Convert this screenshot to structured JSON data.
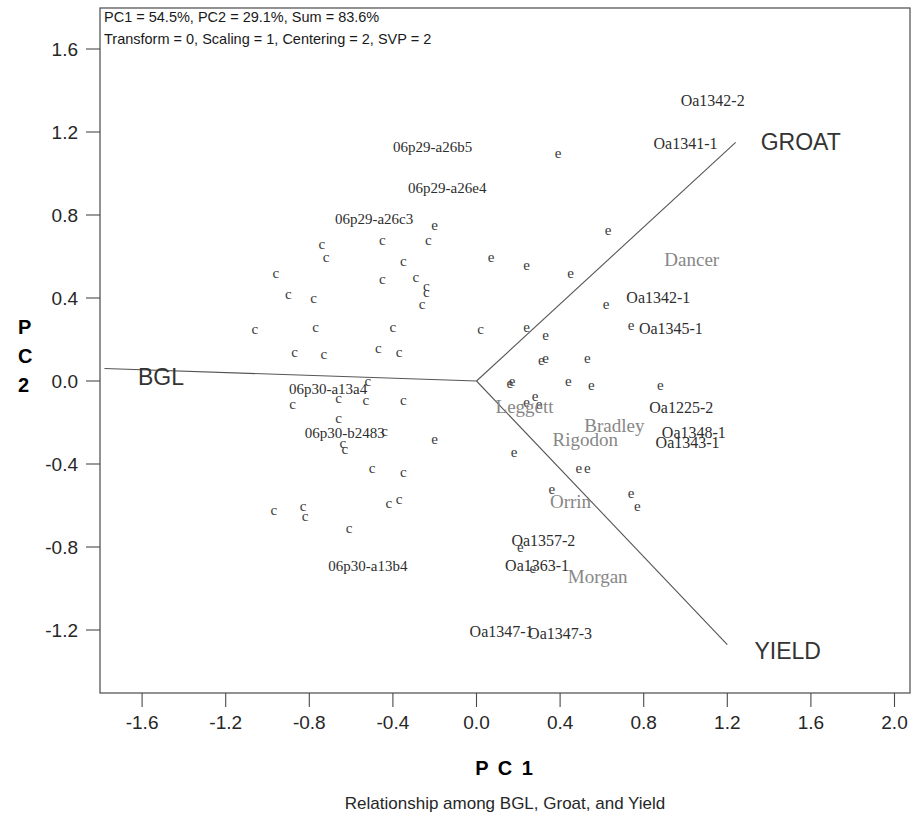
{
  "header": {
    "line1": "PC1 = 54.5%, PC2 = 29.1%, Sum = 83.6%",
    "line2": "Transform = 0, Scaling = 1, Centering = 2, SVP = 2"
  },
  "caption": "Relationship among BGL, Groat, and Yield",
  "axis": {
    "x_title": "P C 1",
    "y_title_chars": [
      "P",
      "C",
      "2"
    ]
  },
  "chart_data": {
    "type": "scatter",
    "title": "Relationship among BGL, Groat, and Yield",
    "subtitle": "PC1 = 54.5%, PC2 = 29.1%, Sum = 83.6%",
    "annotation": "Transform = 0, Scaling = 1, Centering = 2, SVP = 2",
    "xlabel": "P C 1",
    "ylabel": "P C 2",
    "xlim": [
      -1.8,
      2.1
    ],
    "ylim": [
      -1.4,
      1.75
    ],
    "xticks": [
      -1.6,
      -1.2,
      -0.8,
      -0.4,
      0.0,
      0.4,
      0.8,
      1.2,
      1.6,
      2.0
    ],
    "yticks": [
      -1.2,
      -0.8,
      -0.4,
      0.0,
      0.4,
      0.8,
      1.2,
      1.6
    ],
    "xtick_labels": [
      "-1.6",
      "-1.2",
      "-0.8",
      "-0.4",
      "0.0",
      "0.4",
      "0.8",
      "1.2",
      "1.6",
      "2.0"
    ],
    "ytick_labels": [
      "-1.2",
      "-0.8",
      "-0.4",
      "0.0",
      "0.4",
      "0.8",
      "1.2",
      "1.6"
    ],
    "grid": false,
    "legend": "none",
    "variance_explained": {
      "PC1": 54.5,
      "PC2": 29.1,
      "Sum": 83.6
    },
    "biplot_options": {
      "Transform": 0,
      "Scaling": 1,
      "Centering": 2,
      "SVP": 2
    },
    "origin": [
      0.0,
      0.0
    ],
    "vectors": [
      {
        "name": "BGL",
        "label": "BGL",
        "x": -1.78,
        "y": 0.06,
        "label_x": -1.62,
        "label_y": 0.02
      },
      {
        "name": "GROAT",
        "label": "GROAT",
        "x": 1.24,
        "y": 1.15,
        "label_x": 1.36,
        "label_y": 1.15
      },
      {
        "name": "YIELD",
        "label": "YIELD",
        "x": 1.2,
        "y": -1.27,
        "label_x": 1.33,
        "label_y": -1.3
      }
    ],
    "series": [
      {
        "name": "genotypes",
        "marker": "c",
        "points": [
          {
            "x": -0.74,
            "y": 0.66
          },
          {
            "x": -0.72,
            "y": 0.6
          },
          {
            "x": -0.45,
            "y": 0.68
          },
          {
            "x": -0.23,
            "y": 0.68
          },
          {
            "x": -0.35,
            "y": 0.58
          },
          {
            "x": -0.96,
            "y": 0.52
          },
          {
            "x": -0.45,
            "y": 0.49
          },
          {
            "x": -0.29,
            "y": 0.5
          },
          {
            "x": -0.9,
            "y": 0.42
          },
          {
            "x": -0.78,
            "y": 0.4
          },
          {
            "x": -0.24,
            "y": 0.46
          },
          {
            "x": -0.24,
            "y": 0.43
          },
          {
            "x": -0.26,
            "y": 0.37
          },
          {
            "x": -1.06,
            "y": 0.25
          },
          {
            "x": -0.77,
            "y": 0.26
          },
          {
            "x": -0.4,
            "y": 0.26
          },
          {
            "x": 0.02,
            "y": 0.25
          },
          {
            "x": -0.87,
            "y": 0.14
          },
          {
            "x": -0.73,
            "y": 0.13
          },
          {
            "x": -0.47,
            "y": 0.16
          },
          {
            "x": -0.37,
            "y": 0.14
          },
          {
            "x": -0.52,
            "y": 0.0
          },
          {
            "x": -0.66,
            "y": -0.08
          },
          {
            "x": -0.53,
            "y": -0.09
          },
          {
            "x": -0.35,
            "y": -0.09
          },
          {
            "x": -0.88,
            "y": -0.11
          },
          {
            "x": -0.66,
            "y": -0.18
          },
          {
            "x": -0.44,
            "y": -0.24
          },
          {
            "x": -0.63,
            "y": -0.33
          },
          {
            "x": -0.64,
            "y": -0.3
          },
          {
            "x": -0.5,
            "y": -0.42
          },
          {
            "x": -0.35,
            "y": -0.44
          },
          {
            "x": -0.97,
            "y": -0.62
          },
          {
            "x": -0.83,
            "y": -0.6
          },
          {
            "x": -0.82,
            "y": -0.65
          },
          {
            "x": -0.37,
            "y": -0.57
          },
          {
            "x": -0.42,
            "y": -0.59
          },
          {
            "x": -0.61,
            "y": -0.71
          }
        ]
      },
      {
        "name": "environments",
        "marker": "e",
        "points": [
          {
            "x": 0.39,
            "y": 1.1
          },
          {
            "x": 0.63,
            "y": 0.73
          },
          {
            "x": -0.2,
            "y": 0.75
          },
          {
            "x": 0.24,
            "y": 0.56
          },
          {
            "x": 0.45,
            "y": 0.52
          },
          {
            "x": 0.62,
            "y": 0.37
          },
          {
            "x": 0.24,
            "y": 0.26
          },
          {
            "x": 0.74,
            "y": 0.27
          },
          {
            "x": 0.33,
            "y": 0.22
          },
          {
            "x": 0.31,
            "y": 0.1
          },
          {
            "x": 0.33,
            "y": 0.11
          },
          {
            "x": 0.53,
            "y": 0.11
          },
          {
            "x": 0.17,
            "y": 0.0
          },
          {
            "x": 0.16,
            "y": -0.01
          },
          {
            "x": 0.44,
            "y": 0.0
          },
          {
            "x": 0.55,
            "y": -0.02
          },
          {
            "x": 0.88,
            "y": -0.02
          },
          {
            "x": 0.28,
            "y": -0.07
          },
          {
            "x": 0.24,
            "y": -0.1
          },
          {
            "x": 0.3,
            "y": -0.11
          },
          {
            "x": -0.2,
            "y": -0.28
          },
          {
            "x": 0.18,
            "y": -0.34
          },
          {
            "x": 0.49,
            "y": -0.42
          },
          {
            "x": 0.53,
            "y": -0.42
          },
          {
            "x": 0.36,
            "y": -0.52
          },
          {
            "x": 0.74,
            "y": -0.54
          },
          {
            "x": 0.77,
            "y": -0.6
          },
          {
            "x": 0.21,
            "y": -0.8
          },
          {
            "x": 0.27,
            "y": -0.9
          },
          {
            "x": 0.07,
            "y": 0.6
          }
        ]
      }
    ],
    "point_labels": [
      {
        "text": "06p29-a26b5",
        "x": -0.21,
        "y": 1.13,
        "kind": "genotype"
      },
      {
        "text": "06p29-a26e4",
        "x": -0.14,
        "y": 0.93,
        "kind": "genotype"
      },
      {
        "text": "06p29-a26c3",
        "x": -0.49,
        "y": 0.78,
        "kind": "genotype"
      },
      {
        "text": "06p30-a13a4",
        "x": -0.71,
        "y": -0.04,
        "kind": "genotype"
      },
      {
        "text": "06p30-b2483",
        "x": -0.63,
        "y": -0.25,
        "kind": "genotype"
      },
      {
        "text": "06p30-a13b4",
        "x": -0.52,
        "y": -0.89,
        "kind": "genotype"
      },
      {
        "text": "Oa1342-2",
        "x": 1.13,
        "y": 1.35,
        "kind": "environment"
      },
      {
        "text": "Oa1341-1",
        "x": 1.0,
        "y": 1.14,
        "kind": "environment"
      },
      {
        "text": "Dancer",
        "x": 1.03,
        "y": 0.58,
        "kind": "environment-gray"
      },
      {
        "text": "Oa1342-1",
        "x": 0.87,
        "y": 0.4,
        "kind": "environment"
      },
      {
        "text": "Oa1345-1",
        "x": 0.93,
        "y": 0.25,
        "kind": "environment"
      },
      {
        "text": "Leggett",
        "x": 0.23,
        "y": -0.13,
        "kind": "environment-gray"
      },
      {
        "text": "Oa1225-2",
        "x": 0.98,
        "y": -0.13,
        "kind": "environment"
      },
      {
        "text": "Bradley",
        "x": 0.66,
        "y": -0.22,
        "kind": "environment-gray"
      },
      {
        "text": "Rigodon",
        "x": 0.52,
        "y": -0.29,
        "kind": "environment-gray"
      },
      {
        "text": "Oa1348-1",
        "x": 1.04,
        "y": -0.25,
        "kind": "environment"
      },
      {
        "text": "Oa1343-1",
        "x": 1.01,
        "y": -0.3,
        "kind": "environment"
      },
      {
        "text": "Orrin",
        "x": 0.45,
        "y": -0.59,
        "kind": "environment-gray"
      },
      {
        "text": "Oa1357-2",
        "x": 0.32,
        "y": -0.77,
        "kind": "environment"
      },
      {
        "text": "Oa1363-1",
        "x": 0.29,
        "y": -0.89,
        "kind": "environment"
      },
      {
        "text": "Morgan",
        "x": 0.58,
        "y": -0.95,
        "kind": "environment-gray"
      },
      {
        "text": "Oa1347-1",
        "x": 0.12,
        "y": -1.21,
        "kind": "environment"
      },
      {
        "text": "Oa1347-3",
        "x": 0.4,
        "y": -1.22,
        "kind": "environment"
      }
    ]
  }
}
